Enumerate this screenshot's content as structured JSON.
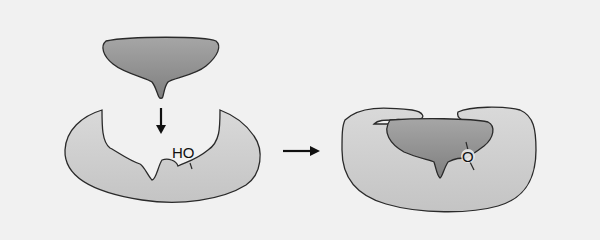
{
  "diagram": {
    "type": "enzyme-substrate binding",
    "background": "#f1f1f1",
    "colors": {
      "enzyme_fill": "#cfcfcf",
      "substrate_fill": "#8f8f8f",
      "outline": "#2a2a2a",
      "arrow": "#111111"
    },
    "left": {
      "substrate_label": "",
      "enzyme_group_label": "HO"
    },
    "right": {
      "bond_label": "O"
    },
    "arrows": {
      "down": "binding-arrow-down",
      "right": "reaction-arrow-right"
    }
  }
}
